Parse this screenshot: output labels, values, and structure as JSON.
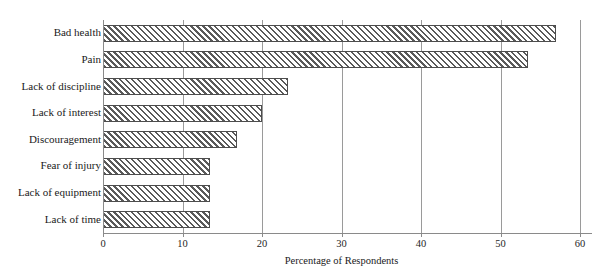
{
  "chart_data": {
    "type": "bar",
    "orientation": "horizontal",
    "title": "",
    "xlabel": "Percentage of Respondents",
    "ylabel": "",
    "categories": [
      "Bad health",
      "Pain",
      "Lack of discipline",
      "Lack of interest",
      "Discouragement",
      "Fear of injury",
      "Lack of equipment",
      "Lack of time"
    ],
    "values": [
      57,
      53.5,
      23.3,
      20,
      16.8,
      13.4,
      13.4,
      13.4
    ],
    "xlim": [
      0,
      60
    ],
    "xticks": [
      0,
      10,
      20,
      30,
      40,
      50,
      60
    ],
    "xtick_labels": [
      "0",
      "10",
      "20",
      "30",
      "40",
      "50",
      "60"
    ],
    "grid": "vertical gridlines at each x tick",
    "legend": "none",
    "bar_fill": "diagonal hatch",
    "colors": {
      "hatch": "#5a5a5a",
      "bar_border": "#4d4d4d",
      "bar_background": "#ffffff",
      "gridline": "#9a9a9a",
      "axis": "#8a8a8a",
      "text": "#1a1a1a"
    }
  }
}
